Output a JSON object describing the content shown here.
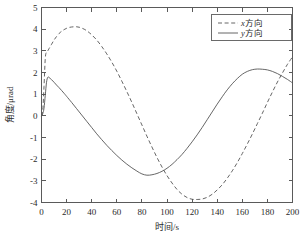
{
  "chart_data": {
    "type": "line",
    "title": "",
    "xlabel": "时间/s",
    "ylabel": "角度/μrad",
    "xlim": [
      0,
      200
    ],
    "ylim": [
      -4,
      5
    ],
    "grid": false,
    "legend_position": "top-right",
    "xticks": [
      0,
      20,
      40,
      60,
      80,
      100,
      120,
      140,
      160,
      180,
      200
    ],
    "xtick_labels": [
      "0",
      "20",
      "40",
      "60",
      "80",
      "100",
      "120",
      "140",
      "160",
      "180",
      "200"
    ],
    "yticks": [
      -4,
      -3,
      -2,
      -1,
      0,
      1,
      2,
      3,
      4,
      5
    ],
    "ytick_labels": [
      "-4",
      "-3",
      "-2",
      "-1",
      "0",
      "1",
      "2",
      "3",
      "4",
      "5"
    ],
    "series": [
      {
        "name": "x方向",
        "legend_label_prefix": "x",
        "legend_label_suffix": "方向",
        "style": "dashed",
        "color": "#555555",
        "x": [
          0,
          1,
          2,
          3,
          4,
          5,
          6,
          8,
          10,
          12,
          14,
          16,
          18,
          20,
          22,
          24,
          26,
          28,
          30,
          32,
          34,
          36,
          38,
          40,
          44,
          48,
          52,
          56,
          60,
          64,
          68,
          72,
          76,
          80,
          84,
          88,
          92,
          96,
          100,
          104,
          108,
          112,
          116,
          120,
          124,
          128,
          132,
          136,
          140,
          144,
          148,
          152,
          156,
          160,
          164,
          168,
          172,
          176,
          180,
          184,
          188,
          192,
          196,
          200
        ],
        "y": [
          0.0,
          0.25,
          1.35,
          2.65,
          2.95,
          3.0,
          3.1,
          3.3,
          3.5,
          3.66,
          3.8,
          3.9,
          3.98,
          4.04,
          4.08,
          4.1,
          4.11,
          4.11,
          4.09,
          4.05,
          4.0,
          3.93,
          3.84,
          3.74,
          3.5,
          3.2,
          2.86,
          2.48,
          2.06,
          1.6,
          1.12,
          0.62,
          0.1,
          -0.42,
          -0.94,
          -1.44,
          -1.92,
          -2.36,
          -2.76,
          -3.1,
          -3.4,
          -3.62,
          -3.77,
          -3.85,
          -3.86,
          -3.84,
          -3.76,
          -3.62,
          -3.42,
          -3.18,
          -2.88,
          -2.54,
          -2.16,
          -1.74,
          -1.3,
          -0.84,
          -0.36,
          0.12,
          0.62,
          1.1,
          1.56,
          1.98,
          2.38,
          2.72
        ]
      },
      {
        "name": "y方向",
        "legend_label_prefix": "y",
        "legend_label_suffix": "方向",
        "style": "solid",
        "color": "#555555",
        "x": [
          0,
          1,
          2,
          3,
          4,
          5,
          6,
          8,
          10,
          12,
          14,
          16,
          18,
          20,
          24,
          28,
          32,
          36,
          40,
          44,
          48,
          52,
          56,
          60,
          64,
          68,
          72,
          76,
          80,
          84,
          88,
          92,
          96,
          100,
          104,
          108,
          112,
          116,
          120,
          124,
          128,
          132,
          136,
          140,
          144,
          148,
          152,
          156,
          160,
          164,
          168,
          172,
          176,
          180,
          184,
          188,
          192,
          196,
          200
        ],
        "y": [
          0.0,
          0.1,
          0.35,
          0.95,
          1.55,
          1.78,
          1.77,
          1.67,
          1.55,
          1.42,
          1.3,
          1.17,
          1.04,
          0.9,
          0.62,
          0.33,
          0.04,
          -0.25,
          -0.54,
          -0.83,
          -1.1,
          -1.36,
          -1.6,
          -1.83,
          -2.04,
          -2.23,
          -2.4,
          -2.55,
          -2.68,
          -2.74,
          -2.72,
          -2.66,
          -2.56,
          -2.42,
          -2.24,
          -2.02,
          -1.78,
          -1.5,
          -1.2,
          -0.88,
          -0.54,
          -0.18,
          0.18,
          0.54,
          0.88,
          1.2,
          1.48,
          1.72,
          1.92,
          2.05,
          2.13,
          2.16,
          2.15,
          2.12,
          2.05,
          1.95,
          1.82,
          1.68,
          1.52
        ]
      }
    ]
  },
  "legend": {
    "entries": [
      {
        "label": "x方向",
        "italic_part": "x",
        "rest": "方向",
        "style": "dashed"
      },
      {
        "label": "y方向",
        "italic_part": "y",
        "rest": "方向",
        "style": "solid"
      }
    ]
  },
  "axes": {
    "x_title": "时间/s",
    "y_title": "角度/μrad"
  },
  "colors": {
    "line": "#555555",
    "axis": "#5a5a5a",
    "text": "#2b2b2b",
    "background": "#ffffff"
  }
}
